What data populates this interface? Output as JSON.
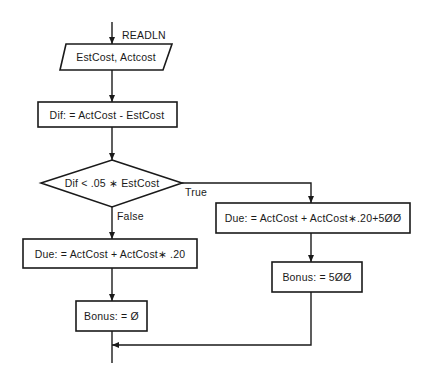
{
  "diagram": {
    "type": "flowchart",
    "io_label": "READLN",
    "nodes": {
      "input": {
        "shape": "parallelogram",
        "text": "EstCost, Actcost"
      },
      "dif": {
        "shape": "rectangle",
        "text": "Dif: = ActCost - EstCost"
      },
      "decision": {
        "shape": "diamond",
        "text": "Dif < .05 ∗ EstCost"
      },
      "due_false": {
        "shape": "rectangle",
        "text": "Due: = ActCost + ActCost∗ .20"
      },
      "bonus_false": {
        "shape": "rectangle",
        "text": "Bonus: = Ø"
      },
      "due_true": {
        "shape": "rectangle",
        "text": "Due: = ActCost + ActCost∗.20+5ØØ"
      },
      "bonus_true": {
        "shape": "rectangle",
        "text": "Bonus: = 5ØØ"
      }
    },
    "branch_labels": {
      "true": "True",
      "false": "False"
    },
    "edges": [
      {
        "from": "start",
        "to": "input"
      },
      {
        "from": "input",
        "to": "dif"
      },
      {
        "from": "dif",
        "to": "decision"
      },
      {
        "from": "decision",
        "to": "due_false",
        "label": "False"
      },
      {
        "from": "decision",
        "to": "due_true",
        "label": "True"
      },
      {
        "from": "due_false",
        "to": "bonus_false"
      },
      {
        "from": "due_true",
        "to": "bonus_true"
      },
      {
        "from": "bonus_true",
        "to": "merge"
      },
      {
        "from": "bonus_false",
        "to": "merge"
      }
    ]
  }
}
